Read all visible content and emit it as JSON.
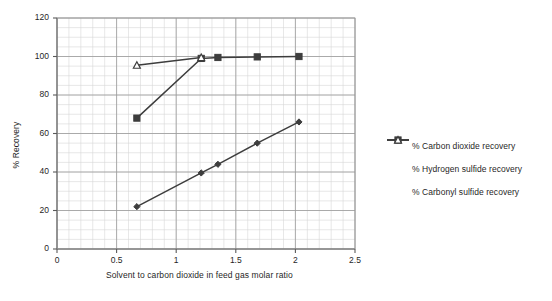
{
  "chart_data": {
    "type": "line",
    "title": "",
    "xlabel": "Solvent to carbon dioxide in feed gas molar ratio",
    "ylabel": "% Recovery",
    "xlim": [
      0,
      2.5
    ],
    "ylim": [
      0,
      120
    ],
    "xticks": [
      "0",
      "0.5",
      "1",
      "1.5",
      "2",
      "2.5"
    ],
    "xtick_values": [
      0,
      0.5,
      1,
      1.5,
      2,
      2.5
    ],
    "yticks": [
      "0",
      "20",
      "40",
      "60",
      "80",
      "100",
      "120"
    ],
    "ytick_values": [
      0,
      20,
      40,
      60,
      80,
      100,
      120
    ],
    "grid": "major and minor gridlines on both axes",
    "x_minor_step": 0.1,
    "y_minor_step": 5,
    "legend_position": "right",
    "series": [
      {
        "name": "% Carbon dioxide recovery",
        "marker": "diamond",
        "color": "#3d3d3d",
        "x": [
          0.67,
          1.21,
          1.35,
          1.68,
          2.03
        ],
        "y": [
          22,
          39.5,
          44,
          55,
          66
        ]
      },
      {
        "name": "% Hydrogen sulfide recovery",
        "marker": "square",
        "color": "#3d3d3d",
        "x": [
          0.67,
          1.21,
          1.35,
          1.68,
          2.03
        ],
        "y": [
          68,
          99,
          99.5,
          99.8,
          100
        ]
      },
      {
        "name": "% Carbonyl sulfide recovery",
        "marker": "triangle",
        "color": "#3d3d3d",
        "x": [
          0.67,
          1.21
        ],
        "y": [
          95.5,
          99.5
        ]
      }
    ]
  },
  "legend": {
    "items": [
      {
        "label": "% Carbon dioxide recovery",
        "marker": "diamond"
      },
      {
        "label": "% Hydrogen sulfide recovery",
        "marker": "square"
      },
      {
        "label": "% Carbonyl sulfide recovery",
        "marker": "triangle"
      }
    ]
  },
  "colors": {
    "series": "#3d3d3d",
    "major_grid": "#9a9a9a",
    "minor_grid": "#d6d6d6",
    "axis": "#5a5a5a",
    "text": "#1f1f1f"
  }
}
